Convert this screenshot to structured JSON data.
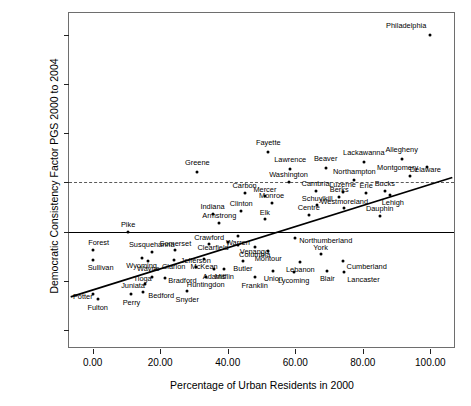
{
  "chart_data": {
    "type": "scatter",
    "title": "",
    "xlabel": "Percentage of Urban Residents in 2000",
    "ylabel": "Democratic Consistency Factor PGS 2000 to 2004",
    "xlim": [
      -7.0,
      107.0
    ],
    "ylim": [
      -2.35,
      4.45
    ],
    "xticks": [
      0,
      20,
      40,
      60,
      80,
      100
    ],
    "xticklabels": [
      "0.00",
      "20.00",
      "40.00",
      "60.00",
      "80.00",
      "100.00"
    ],
    "yticks": [
      -2,
      -1,
      0,
      1,
      2,
      3,
      4
    ],
    "yticklabels": [
      "-2.00",
      "-1.00",
      "0.00",
      "1.00",
      "2.00",
      "3.00",
      "4.00"
    ],
    "grid": false,
    "legend": null,
    "reference_lines": [
      {
        "name": "zero-line",
        "axis": "y",
        "value": 0,
        "style": "solid",
        "color": "#000000"
      },
      {
        "name": "one-line",
        "axis": "y",
        "value": 1,
        "style": "dashed",
        "color": "#5a5a5a"
      }
    ],
    "fit_line": {
      "name": "regression-line",
      "style": "solid",
      "color": "#000000",
      "x0": -6.5,
      "y0": -1.33,
      "x1": 106.5,
      "y1": 1.1
    },
    "points": [
      {
        "label": "Philadelphia",
        "x": 100.0,
        "y": 4.0,
        "anchor": "right",
        "dx": -4,
        "dy": -9
      },
      {
        "label": "Allegheny",
        "x": 91.5,
        "y": 1.47,
        "anchor": "center",
        "dx": 0,
        "dy": -9
      },
      {
        "label": "Lackawanna",
        "x": 80.3,
        "y": 1.42,
        "anchor": "center",
        "dx": 0,
        "dy": -9
      },
      {
        "label": "Delaware",
        "x": 99.0,
        "y": 1.32,
        "anchor": "right",
        "dx": 14,
        "dy": 3
      },
      {
        "label": "Fayette",
        "x": 52.0,
        "y": 1.62,
        "anchor": "center",
        "dx": 0,
        "dy": -9
      },
      {
        "label": "Beaver",
        "x": 69.0,
        "y": 1.29,
        "anchor": "center",
        "dx": 0,
        "dy": -9
      },
      {
        "label": "Lawrence",
        "x": 58.5,
        "y": 1.27,
        "anchor": "center",
        "dx": 0,
        "dy": -9
      },
      {
        "label": "Montgomery",
        "x": 94.0,
        "y": 1.13,
        "anchor": "right",
        "dx": 8,
        "dy": -8
      },
      {
        "label": "Greene",
        "x": 31.0,
        "y": 1.22,
        "anchor": "center",
        "dx": 0,
        "dy": -9
      },
      {
        "label": "Northampton",
        "x": 77.5,
        "y": 1.06,
        "anchor": "center",
        "dx": 0,
        "dy": -8
      },
      {
        "label": "Washington",
        "x": 58.0,
        "y": 1.0,
        "anchor": "center",
        "dx": 0,
        "dy": -7
      },
      {
        "label": "Cambria",
        "x": 66.0,
        "y": 0.82,
        "anchor": "center",
        "dx": 0,
        "dy": -7
      },
      {
        "label": "Luzerne",
        "x": 74.0,
        "y": 0.8,
        "anchor": "center",
        "dx": 0,
        "dy": -7
      },
      {
        "label": "Erie",
        "x": 81.0,
        "y": 0.79,
        "anchor": "center",
        "dx": 0,
        "dy": -7
      },
      {
        "label": "Bucks",
        "x": 86.5,
        "y": 0.82,
        "anchor": "center",
        "dx": 0,
        "dy": -7
      },
      {
        "label": "Lehigh",
        "x": 88.0,
        "y": 0.74,
        "anchor": "center",
        "dx": 3,
        "dy": 8
      },
      {
        "label": "Carbon",
        "x": 45.0,
        "y": 0.79,
        "anchor": "center",
        "dx": 0,
        "dy": -7
      },
      {
        "label": "Mercer",
        "x": 51.0,
        "y": 0.72,
        "anchor": "center",
        "dx": 0,
        "dy": -6
      },
      {
        "label": "Berks",
        "x": 73.0,
        "y": 0.71,
        "anchor": "center",
        "dx": 0,
        "dy": -7
      },
      {
        "label": "Monroe",
        "x": 53.0,
        "y": 0.58,
        "anchor": "center",
        "dx": 0,
        "dy": -7
      },
      {
        "label": "Schuylkill",
        "x": 66.5,
        "y": 0.55,
        "anchor": "center",
        "dx": 0,
        "dy": -6
      },
      {
        "label": "Westmoreland",
        "x": 74.5,
        "y": 0.48,
        "anchor": "center",
        "dx": 0,
        "dy": -6
      },
      {
        "label": "Dauphin",
        "x": 85.0,
        "y": 0.31,
        "anchor": "center",
        "dx": 0,
        "dy": -7
      },
      {
        "label": "Clinton",
        "x": 44.0,
        "y": 0.42,
        "anchor": "center",
        "dx": 0,
        "dy": -7
      },
      {
        "label": "Indiana",
        "x": 35.5,
        "y": 0.35,
        "anchor": "center",
        "dx": 0,
        "dy": -7
      },
      {
        "label": "Centre",
        "x": 64.0,
        "y": 0.33,
        "anchor": "center",
        "dx": 0,
        "dy": -7
      },
      {
        "label": "Elk",
        "x": 51.0,
        "y": 0.25,
        "anchor": "center",
        "dx": 0,
        "dy": -6
      },
      {
        "label": "Armstrong",
        "x": 37.5,
        "y": 0.17,
        "anchor": "center",
        "dx": 0,
        "dy": -7
      },
      {
        "label": "Pike",
        "x": 10.5,
        "y": 0.0,
        "anchor": "center",
        "dx": 0,
        "dy": -7
      },
      {
        "label": "Warren",
        "x": 43.0,
        "y": -0.1,
        "anchor": "center",
        "dx": 0,
        "dy": 7
      },
      {
        "label": "Northumberland",
        "x": 60.0,
        "y": -0.14,
        "anchor": "left",
        "dx": 4,
        "dy": 3
      },
      {
        "label": "Clearfield",
        "x": 40.0,
        "y": -0.22,
        "anchor": "right",
        "dx": 1,
        "dy": 6
      },
      {
        "label": "Venango",
        "x": 43.0,
        "y": -0.28,
        "anchor": "left",
        "dx": 2,
        "dy": 7
      },
      {
        "label": "Columbia",
        "x": 48.0,
        "y": -0.31,
        "anchor": "center",
        "dx": 0,
        "dy": 8
      },
      {
        "label": "Crawford",
        "x": 34.5,
        "y": -0.26,
        "anchor": "center",
        "dx": 0,
        "dy": -6
      },
      {
        "label": "Forest",
        "x": 0.0,
        "y": -0.37,
        "anchor": "center",
        "dx": 6,
        "dy": -7
      },
      {
        "label": "Susquehanna",
        "x": 17.5,
        "y": -0.42,
        "anchor": "center",
        "dx": 0,
        "dy": -7
      },
      {
        "label": "Somerset",
        "x": 24.5,
        "y": -0.38,
        "anchor": "center",
        "dx": 0,
        "dy": -6
      },
      {
        "label": "Montour",
        "x": 52.0,
        "y": -0.4,
        "anchor": "center",
        "dx": 0,
        "dy": 8
      },
      {
        "label": "York",
        "x": 67.5,
        "y": -0.45,
        "anchor": "center",
        "dx": 0,
        "dy": -6
      },
      {
        "label": "Sullivan",
        "x": 0.0,
        "y": -0.57,
        "anchor": "center",
        "dx": 8,
        "dy": 8
      },
      {
        "label": "Wyoming",
        "x": 14.5,
        "y": -0.53,
        "anchor": "center",
        "dx": 0,
        "dy": 8
      },
      {
        "label": "Wayne",
        "x": 16.5,
        "y": -0.6,
        "anchor": "center",
        "dx": 0,
        "dy": 8
      },
      {
        "label": "Clarion",
        "x": 24.0,
        "y": -0.58,
        "anchor": "center",
        "dx": 0,
        "dy": 7
      },
      {
        "label": "McKean",
        "x": 33.0,
        "y": -0.55,
        "anchor": "center",
        "dx": 0,
        "dy": 8
      },
      {
        "label": "Butler",
        "x": 44.5,
        "y": -0.6,
        "anchor": "center",
        "dx": 0,
        "dy": 8
      },
      {
        "label": "Lebanon",
        "x": 61.5,
        "y": -0.61,
        "anchor": "center",
        "dx": 0,
        "dy": 8
      },
      {
        "label": "Cumberland",
        "x": 74.0,
        "y": -0.6,
        "anchor": "left",
        "dx": 4,
        "dy": 6
      },
      {
        "label": "Jefferson",
        "x": 30.5,
        "y": -0.72,
        "anchor": "center",
        "dx": 0,
        "dy": -6
      },
      {
        "label": "Adams",
        "x": 36.0,
        "y": -0.77,
        "anchor": "center",
        "dx": 0,
        "dy": 8
      },
      {
        "label": "Mifflin",
        "x": 39.0,
        "y": -0.77,
        "anchor": "center",
        "dx": 0,
        "dy": 8
      },
      {
        "label": "Union",
        "x": 53.5,
        "y": -0.8,
        "anchor": "center",
        "dx": 0,
        "dy": 8
      },
      {
        "label": "Lycoming",
        "x": 59.5,
        "y": -0.83,
        "anchor": "center",
        "dx": 0,
        "dy": 9
      },
      {
        "label": "Blair",
        "x": 69.5,
        "y": -0.8,
        "anchor": "center",
        "dx": 0,
        "dy": 8
      },
      {
        "label": "Lancaster",
        "x": 74.5,
        "y": -0.83,
        "anchor": "left",
        "dx": 3,
        "dy": 8
      },
      {
        "label": "Tioga",
        "x": 17.5,
        "y": -0.93,
        "anchor": "right",
        "dx": 0,
        "dy": 2
      },
      {
        "label": "Bradford",
        "x": 21.5,
        "y": -0.95,
        "anchor": "left",
        "dx": 3,
        "dy": 3
      },
      {
        "label": "Huntingdon",
        "x": 33.5,
        "y": -0.93,
        "anchor": "center",
        "dx": 0,
        "dy": 8
      },
      {
        "label": "Franklin",
        "x": 48.0,
        "y": -0.92,
        "anchor": "center",
        "dx": 0,
        "dy": 9
      },
      {
        "label": "Juniata",
        "x": 15.5,
        "y": -1.07,
        "anchor": "right",
        "dx": 0,
        "dy": 2
      },
      {
        "label": "Bedford",
        "x": 15.0,
        "y": -1.23,
        "anchor": "left",
        "dx": 5,
        "dy": 4
      },
      {
        "label": "Snyder",
        "x": 28.0,
        "y": -1.2,
        "anchor": "center",
        "dx": 0,
        "dy": 9
      },
      {
        "label": "Perry",
        "x": 11.5,
        "y": -1.27,
        "anchor": "center",
        "dx": 0,
        "dy": 9
      },
      {
        "label": "Potter",
        "x": 0.0,
        "y": -1.28,
        "anchor": "right",
        "dx": 0,
        "dy": 3
      },
      {
        "label": "Fulton",
        "x": 1.5,
        "y": -1.38,
        "anchor": "center",
        "dx": 0,
        "dy": 9
      }
    ]
  }
}
